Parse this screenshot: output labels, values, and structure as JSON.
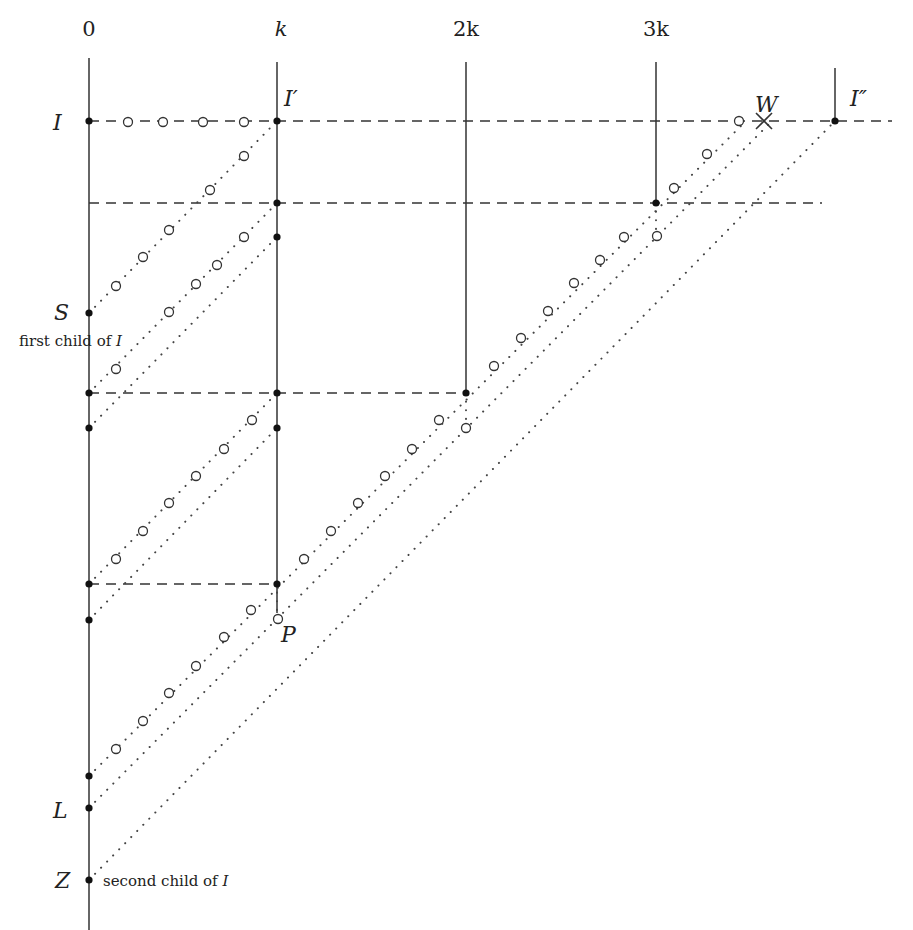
{
  "figure": {
    "axis_labels": [
      "0",
      "k",
      "2k",
      "3k"
    ],
    "axis_positions_x": [
      89,
      277,
      466,
      656
    ],
    "point_labels": {
      "I": "I",
      "I_prime": "I′",
      "I_double_prime": "I″",
      "W": "W",
      "S": "S",
      "P": "P",
      "L": "L",
      "Z": "Z"
    },
    "annotations": {
      "first_child_prefix": "first child of ",
      "first_child_var": "I",
      "second_child_prefix": "second child of ",
      "second_child_var": "I"
    },
    "vertical_lines": [
      {
        "x": 89,
        "y1": 58,
        "y2": 930
      },
      {
        "x": 277,
        "y1": 62,
        "y2": 613
      },
      {
        "x": 466,
        "y1": 62,
        "y2": 393
      },
      {
        "x": 656,
        "y1": 62,
        "y2": 203
      },
      {
        "x": 835,
        "y1": 68,
        "y2": 121
      }
    ],
    "dashed_horizontals": [
      {
        "y": 121,
        "x1": 89,
        "x2": 892
      },
      {
        "y": 203,
        "x1": 89,
        "x2": 822
      },
      {
        "y": 393,
        "x1": 89,
        "x2": 466
      },
      {
        "y": 584,
        "x1": 89,
        "x2": 277
      }
    ],
    "filled_points": [
      [
        89,
        121
      ],
      [
        89,
        313
      ],
      [
        89,
        393
      ],
      [
        89,
        428
      ],
      [
        89,
        584
      ],
      [
        89,
        620
      ],
      [
        89,
        776
      ],
      [
        89,
        808
      ],
      [
        89,
        880
      ],
      [
        277,
        121
      ],
      [
        277,
        203
      ],
      [
        277,
        237
      ],
      [
        277,
        393
      ],
      [
        277,
        428
      ],
      [
        277,
        584
      ],
      [
        466,
        393
      ],
      [
        656,
        203
      ],
      [
        835,
        121
      ]
    ],
    "marker_W": {
      "x": 764,
      "y": 121
    }
  }
}
